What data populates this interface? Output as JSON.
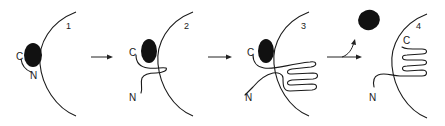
{
  "diagram": {
    "type": "process-sequence",
    "panels": [
      {
        "id": 1,
        "label": "1",
        "terminus_labels": {
          "c": "C",
          "n": "N"
        },
        "blob": "bound-to-chain",
        "loops": 0
      },
      {
        "id": 2,
        "label": "2",
        "terminus_labels": {
          "c": "C",
          "n": "N"
        },
        "blob": "bound-to-chain",
        "loops": 1
      },
      {
        "id": 3,
        "label": "3",
        "terminus_labels": {
          "c": "C",
          "n": "N"
        },
        "blob": "bound-to-chain",
        "loops": 3
      },
      {
        "id": 4,
        "label": "4",
        "terminus_labels": {
          "c": "C",
          "n": "N"
        },
        "blob": "released",
        "loops": 3
      }
    ],
    "arrows": [
      {
        "from": 1,
        "to": 2,
        "style": "straight"
      },
      {
        "from": 2,
        "to": 3,
        "style": "straight"
      },
      {
        "from": 3,
        "to": 4,
        "style": "straight-with-branch-release"
      }
    ],
    "colors": {
      "ink": "#1a1a1a",
      "blob": "#111111",
      "background": "#ffffff"
    }
  }
}
